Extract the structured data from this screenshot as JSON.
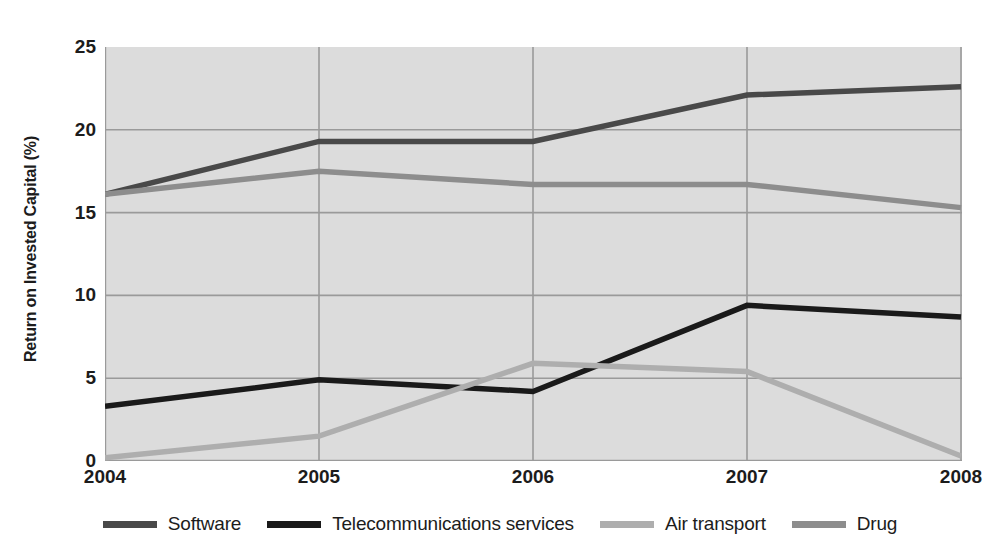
{
  "chart_data": {
    "type": "line",
    "title": "",
    "subtitle": "",
    "xlabel": "",
    "ylabel": "Return on Invested Capital (%)",
    "categories": [
      "2004",
      "2005",
      "2006",
      "2007",
      "2008"
    ],
    "x": [
      2004,
      2005,
      2006,
      2007,
      2008
    ],
    "xlim": [
      2004,
      2008
    ],
    "ylim": [
      0,
      25
    ],
    "yticks": [
      0,
      5,
      10,
      15,
      20,
      25
    ],
    "xticks": [
      "2004",
      "2005",
      "2006",
      "2007",
      "2008"
    ],
    "grid": true,
    "legend_position": "bottom",
    "plot_background": "#dcdcdc",
    "gridline_color": "#9a9a9a",
    "series": [
      {
        "name": "Software",
        "color": "#494949",
        "values": [
          16.1,
          19.3,
          19.3,
          22.1,
          22.6
        ]
      },
      {
        "name": "Telecommunications services",
        "color": "#1a1a1a",
        "values": [
          3.3,
          4.9,
          4.2,
          9.4,
          8.7
        ]
      },
      {
        "name": "Air transport",
        "color": "#aeaeae",
        "values": [
          0.2,
          1.5,
          5.9,
          5.4,
          0.3
        ]
      },
      {
        "name": "Drug",
        "color": "#8d8d8d",
        "values": [
          16.1,
          17.5,
          16.7,
          16.7,
          15.3
        ]
      }
    ]
  },
  "axis": {
    "y_title": "Return on Invested Capital (%)",
    "y_tick_labels": [
      "25",
      "20",
      "15",
      "10",
      "5",
      "0"
    ],
    "x_tick_labels": [
      "2004",
      "2005",
      "2006",
      "2007",
      "2008"
    ]
  },
  "legend": {
    "items": [
      {
        "label": "Software",
        "color": "#494949"
      },
      {
        "label": "Telecommunications services",
        "color": "#1a1a1a"
      },
      {
        "label": "Air transport",
        "color": "#aeaeae"
      },
      {
        "label": "Drug",
        "color": "#8d8d8d"
      }
    ]
  }
}
